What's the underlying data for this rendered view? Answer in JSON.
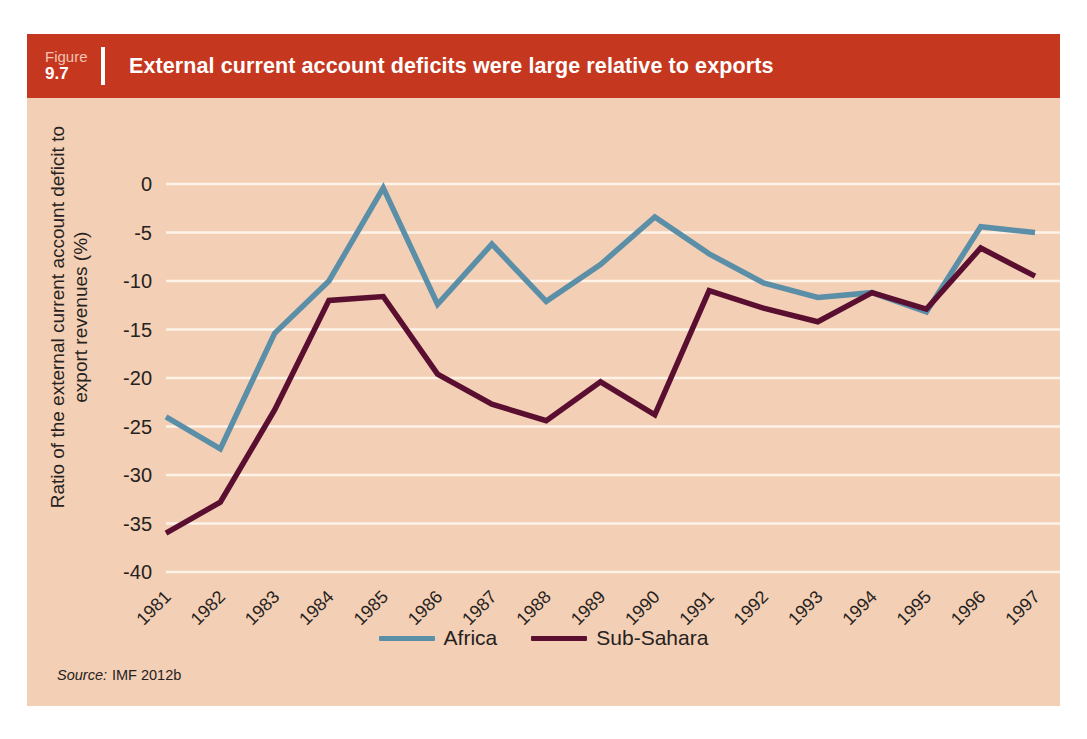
{
  "figure": {
    "label_word": "Figure",
    "number": "9.7",
    "title": "External current account deficits were large relative to exports"
  },
  "source": {
    "prefix": "Source:",
    "text": "IMF 2012b"
  },
  "colors": {
    "header_bg": "#c6371f",
    "panel_bg": "#f3cfb5",
    "gridline": "#fdf3e8",
    "africa": "#5b8fa8",
    "sub_sahara": "#5a0f31",
    "text": "#262220"
  },
  "chart_data": {
    "type": "line",
    "title": "External current account deficits were large relative to exports",
    "xlabel": "",
    "ylabel": "Ratio of the external current account deficit to export revenues (%)",
    "ylim": [
      -40,
      0
    ],
    "yticks": [
      0,
      -5,
      -10,
      -15,
      -20,
      -25,
      -30,
      -35,
      -40
    ],
    "ytick_labels": [
      "0",
      "-5",
      "-10",
      "-15",
      "-20",
      "-25",
      "-30",
      "-35",
      "-40"
    ],
    "grid": true,
    "legend_position": "bottom-center",
    "categories": [
      "1981",
      "1982",
      "1983",
      "1984",
      "1985",
      "1986",
      "1987",
      "1988",
      "1989",
      "1990",
      "1991",
      "1992",
      "1993",
      "1994",
      "1995",
      "1996",
      "1997"
    ],
    "series": [
      {
        "name": "Africa",
        "color": "#5b8fa8",
        "values": [
          -24.0,
          -27.3,
          -15.4,
          -10.0,
          -0.4,
          -12.4,
          -6.2,
          -12.1,
          -8.3,
          -3.4,
          -7.2,
          -10.2,
          -11.7,
          -11.2,
          -13.2,
          -4.4,
          -5.0
        ]
      },
      {
        "name": "Sub-Sahara",
        "color": "#5a0f31",
        "values": [
          -36.0,
          -32.8,
          -23.3,
          -12.0,
          -11.6,
          -19.6,
          -22.7,
          -24.4,
          -20.4,
          -23.8,
          -11.0,
          -12.8,
          -14.2,
          -11.2,
          -12.9,
          -6.6,
          -9.5
        ]
      }
    ]
  }
}
